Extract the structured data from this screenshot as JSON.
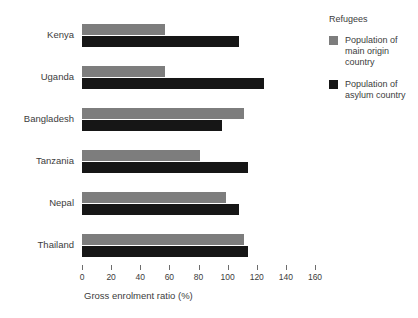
{
  "chart_data": {
    "type": "bar",
    "orientation": "horizontal",
    "title": "",
    "subtitle": "",
    "xlabel": "Gross enrolment ratio (%)",
    "ylabel": "",
    "xlim": [
      0,
      160
    ],
    "xticks": [
      0,
      20,
      40,
      60,
      80,
      100,
      120,
      140,
      160
    ],
    "xtick_labels": [
      "0",
      "20",
      "40",
      "60",
      "80",
      "100",
      "120",
      "140",
      "160"
    ],
    "grid": false,
    "legend_position": "right",
    "legend_title": "Refugees",
    "categories": [
      "Kenya",
      "Uganda",
      "Bangladesh",
      "Tanzania",
      "Nepal",
      "Thailand"
    ],
    "series": [
      {
        "name": "Population of main origin country",
        "color": "#7d7d7d",
        "values": [
          57,
          57,
          111,
          81,
          99,
          111
        ]
      },
      {
        "name": "Population of asylum country",
        "color": "#161616",
        "values": [
          108,
          125,
          96,
          114,
          108,
          114
        ]
      }
    ]
  },
  "axis": {
    "x_title": "Gross enrolment ratio (%)"
  },
  "legend": {
    "title": "Refugees",
    "items": [
      {
        "label": "Population of main origin country",
        "color": "#7d7d7d"
      },
      {
        "label": "Population of asylum country",
        "color": "#161616"
      }
    ]
  }
}
